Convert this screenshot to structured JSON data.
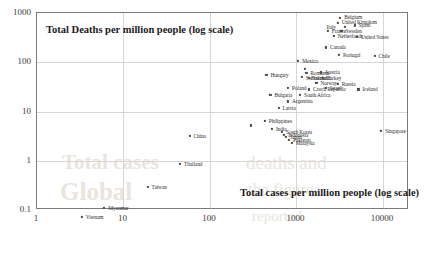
{
  "chart_data": {
    "type": "scatter",
    "title": "",
    "xlabel": "Total cases per million people (log scale)",
    "ylabel": "Total Deaths per million people (log scale)",
    "xscale": "log",
    "yscale": "log",
    "xlim": [
      1,
      20000
    ],
    "ylim": [
      0.1,
      1000
    ],
    "xticks": [
      "1",
      "10",
      "100",
      "1000",
      "10000"
    ],
    "yticks": [
      "1000",
      "100",
      "10",
      "1",
      "0.1"
    ],
    "grid": true,
    "legend": "none",
    "points": [
      {
        "name": "Belgium",
        "x": 3200,
        "y": 800,
        "label_dx": 4,
        "label_dy": -1
      },
      {
        "name": "United Kingdom",
        "x": 3000,
        "y": 620,
        "label_dx": 4,
        "label_dy": -1
      },
      {
        "name": "Italy",
        "x": 3600,
        "y": 520,
        "label_dx": -18,
        "label_dy": 0
      },
      {
        "name": "Spain",
        "x": 4700,
        "y": 560,
        "label_dx": 4,
        "label_dy": 0
      },
      {
        "name": "Sweden",
        "x": 3300,
        "y": 440,
        "label_dx": 4,
        "label_dy": 0
      },
      {
        "name": "France",
        "x": 2300,
        "y": 430,
        "label_dx": 4,
        "label_dy": 0
      },
      {
        "name": "Netherlands",
        "x": 2700,
        "y": 340,
        "label_dx": 4,
        "label_dy": 0
      },
      {
        "name": "United States",
        "x": 5000,
        "y": 330,
        "label_dx": 4,
        "label_dy": 0
      },
      {
        "name": "Canada",
        "x": 2200,
        "y": 200,
        "label_dx": 4,
        "label_dy": 0
      },
      {
        "name": "Portugal",
        "x": 3100,
        "y": 140,
        "label_dx": 4,
        "label_dy": 0
      },
      {
        "name": "Chile",
        "x": 8000,
        "y": 135,
        "label_dx": 4,
        "label_dy": 0
      },
      {
        "name": "Mexico",
        "x": 1050,
        "y": 105,
        "label_dx": 4,
        "label_dy": 0
      },
      {
        "name": "Romania",
        "x": 1300,
        "y": 60,
        "label_dx": 4,
        "label_dy": 0
      },
      {
        "name": "Austria",
        "x": 1900,
        "y": 62,
        "label_dx": 4,
        "label_dy": 0
      },
      {
        "name": "Switzerland",
        "x": 1150,
        "y": 50,
        "label_dx": 4,
        "label_dy": 1
      },
      {
        "name": "Finland",
        "x": 1400,
        "y": 48,
        "label_dx": 2,
        "label_dy": 0
      },
      {
        "name": "Turkey",
        "x": 2000,
        "y": 48,
        "label_dx": 4,
        "label_dy": 0
      },
      {
        "name": "Norway",
        "x": 1700,
        "y": 38,
        "label_dx": 4,
        "label_dy": 0
      },
      {
        "name": "Russia",
        "x": 3000,
        "y": 37,
        "label_dx": 4,
        "label_dy": 0
      },
      {
        "name": "Hungary",
        "x": 450,
        "y": 55,
        "label_dx": 4,
        "label_dy": 0
      },
      {
        "name": "Poland",
        "x": 800,
        "y": 30,
        "label_dx": 4,
        "label_dy": 0
      },
      {
        "name": "Czech Republic",
        "x": 1400,
        "y": 28,
        "label_dx": 4,
        "label_dy": 0
      },
      {
        "name": "Israel",
        "x": 2200,
        "y": 30,
        "label_dx": 4,
        "label_dy": 0
      },
      {
        "name": "Iceland",
        "x": 5200,
        "y": 28,
        "label_dx": 4,
        "label_dy": 0
      },
      {
        "name": "Bulgaria",
        "x": 500,
        "y": 22,
        "label_dx": 4,
        "label_dy": 0
      },
      {
        "name": "South Africa",
        "x": 1100,
        "y": 22,
        "label_dx": 4,
        "label_dy": 0
      },
      {
        "name": "Argentina",
        "x": 800,
        "y": 16,
        "label_dx": 4,
        "label_dy": 0
      },
      {
        "name": "Latvia",
        "x": 620,
        "y": 12,
        "label_dx": 4,
        "label_dy": 0
      },
      {
        "name": "Philippines",
        "x": 430,
        "y": 6.5,
        "label_dx": 4,
        "label_dy": 0
      },
      {
        "name": "India",
        "x": 520,
        "y": 4.4,
        "label_dx": 4,
        "label_dy": 0
      },
      {
        "name": "South Korea",
        "x": 680,
        "y": 3.9,
        "label_dx": 4,
        "label_dy": 0
      },
      {
        "name": "Indonesia",
        "x": 720,
        "y": 3.4,
        "label_dx": 4,
        "label_dy": 0
      },
      {
        "name": "Japan",
        "x": 760,
        "y": 3.0,
        "label_dx": 4,
        "label_dy": 0
      },
      {
        "name": "Pakistan",
        "x": 820,
        "y": 2.7,
        "label_dx": 4,
        "label_dy": 0
      },
      {
        "name": "Malaysia",
        "x": 880,
        "y": 2.3,
        "label_dx": 4,
        "label_dy": 0
      },
      {
        "name": "Singapore",
        "x": 9500,
        "y": 4.0,
        "label_dx": 4,
        "label_dy": 0
      },
      {
        "name": "China",
        "x": 58,
        "y": 3.2,
        "label_dx": 4,
        "label_dy": 0
      },
      {
        "name": "Thailand",
        "x": 45,
        "y": 0.85,
        "label_dx": 4,
        "label_dy": 0
      },
      {
        "name": "Taiwan",
        "x": 19,
        "y": 0.3,
        "label_dx": 4,
        "label_dy": 0
      },
      {
        "name": "Myanmar",
        "x": 6.0,
        "y": 0.11,
        "label_dx": 4,
        "label_dy": 0
      },
      {
        "name": "Vietnam",
        "x": 3.3,
        "y": 0.072,
        "label_dx": 4,
        "label_dy": 0
      },
      {
        "name": "",
        "x": 300,
        "y": 5.2,
        "label_dx": 4,
        "label_dy": 0
      },
      {
        "name": "",
        "x": 1250,
        "y": 72,
        "label_dx": 4,
        "label_dy": 0
      }
    ]
  },
  "watermark": {
    "line1": "Total cases",
    "line2": "Global",
    "line3": "deaths and",
    "line4": "the figures",
    "line5": "reported"
  }
}
